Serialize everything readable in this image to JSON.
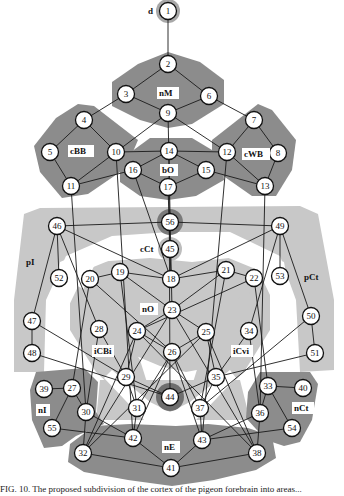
{
  "diagram": {
    "colors": {
      "background": "#ffffff",
      "region_dark": "#8c8c8c",
      "region_light": "#c4c4c4",
      "halo": "#9a9a9a",
      "edge": "#1a1a1a",
      "node_fill": "#ffffff",
      "node_stroke": "#111111",
      "label_box": "#ffffff"
    },
    "regions": [
      {
        "id": "d",
        "label": "d",
        "shade": "halo"
      },
      {
        "id": "nM",
        "label": "nM",
        "shade": "dark"
      },
      {
        "id": "cBB",
        "label": "cBB",
        "shade": "dark"
      },
      {
        "id": "cWB",
        "label": "cWB",
        "shade": "dark"
      },
      {
        "id": "bO",
        "label": "bO",
        "shade": "dark"
      },
      {
        "id": "cCt",
        "label": "cCt",
        "shade": "halo"
      },
      {
        "id": "pI",
        "label": "pI",
        "shade": "light"
      },
      {
        "id": "pCt",
        "label": "pCt",
        "shade": "light"
      },
      {
        "id": "nO",
        "label": "nO",
        "shade": "light"
      },
      {
        "id": "iCBi",
        "label": "iCBi",
        "shade": "light"
      },
      {
        "id": "iCvi",
        "label": "iCvi",
        "shade": "light"
      },
      {
        "id": "nI",
        "label": "nI",
        "shade": "dark"
      },
      {
        "id": "nCt",
        "label": "nCt",
        "shade": "dark"
      },
      {
        "id": "nE",
        "label": "nE",
        "shade": "dark"
      }
    ],
    "nodes": [
      {
        "id": "1",
        "x": 168,
        "y": 11
      },
      {
        "id": "2",
        "x": 168,
        "y": 64
      },
      {
        "id": "3",
        "x": 126,
        "y": 94
      },
      {
        "id": "6",
        "x": 209,
        "y": 96
      },
      {
        "id": "9",
        "x": 168,
        "y": 113
      },
      {
        "id": "4",
        "x": 84,
        "y": 120
      },
      {
        "id": "7",
        "x": 254,
        "y": 120
      },
      {
        "id": "5",
        "x": 50,
        "y": 152
      },
      {
        "id": "10",
        "x": 116,
        "y": 152
      },
      {
        "id": "14",
        "x": 169,
        "y": 151
      },
      {
        "id": "12",
        "x": 227,
        "y": 152
      },
      {
        "id": "8",
        "x": 278,
        "y": 153
      },
      {
        "id": "16",
        "x": 133,
        "y": 170
      },
      {
        "id": "15",
        "x": 206,
        "y": 170
      },
      {
        "id": "17",
        "x": 168,
        "y": 187
      },
      {
        "id": "11",
        "x": 71,
        "y": 186
      },
      {
        "id": "13",
        "x": 265,
        "y": 186
      },
      {
        "id": "56",
        "x": 170,
        "y": 222
      },
      {
        "id": "46",
        "x": 57,
        "y": 226
      },
      {
        "id": "49",
        "x": 280,
        "y": 226
      },
      {
        "id": "45",
        "x": 170,
        "y": 249
      },
      {
        "id": "52",
        "x": 59,
        "y": 278
      },
      {
        "id": "20",
        "x": 90,
        "y": 279
      },
      {
        "id": "19",
        "x": 120,
        "y": 272
      },
      {
        "id": "18",
        "x": 171,
        "y": 279
      },
      {
        "id": "21",
        "x": 226,
        "y": 270
      },
      {
        "id": "22",
        "x": 254,
        "y": 278
      },
      {
        "id": "53",
        "x": 280,
        "y": 276
      },
      {
        "id": "47",
        "x": 32,
        "y": 321
      },
      {
        "id": "23",
        "x": 172,
        "y": 310
      },
      {
        "id": "50",
        "x": 311,
        "y": 316
      },
      {
        "id": "28",
        "x": 99,
        "y": 329
      },
      {
        "id": "24",
        "x": 137,
        "y": 331
      },
      {
        "id": "25",
        "x": 206,
        "y": 332
      },
      {
        "id": "34",
        "x": 249,
        "y": 331
      },
      {
        "id": "48",
        "x": 32,
        "y": 353
      },
      {
        "id": "26",
        "x": 172,
        "y": 352
      },
      {
        "id": "51",
        "x": 315,
        "y": 353
      },
      {
        "id": "29",
        "x": 126,
        "y": 377
      },
      {
        "id": "35",
        "x": 216,
        "y": 377
      },
      {
        "id": "27",
        "x": 72,
        "y": 388
      },
      {
        "id": "39",
        "x": 44,
        "y": 389
      },
      {
        "id": "33",
        "x": 268,
        "y": 386
      },
      {
        "id": "40",
        "x": 303,
        "y": 388
      },
      {
        "id": "44",
        "x": 170,
        "y": 397
      },
      {
        "id": "30",
        "x": 86,
        "y": 412
      },
      {
        "id": "31",
        "x": 137,
        "y": 408
      },
      {
        "id": "37",
        "x": 200,
        "y": 408
      },
      {
        "id": "36",
        "x": 260,
        "y": 413
      },
      {
        "id": "55",
        "x": 52,
        "y": 428
      },
      {
        "id": "54",
        "x": 292,
        "y": 428
      },
      {
        "id": "42",
        "x": 133,
        "y": 438
      },
      {
        "id": "43",
        "x": 202,
        "y": 440
      },
      {
        "id": "32",
        "x": 83,
        "y": 453
      },
      {
        "id": "38",
        "x": 257,
        "y": 453
      },
      {
        "id": "41",
        "x": 171,
        "y": 468
      }
    ],
    "edges": [
      [
        "1",
        "2"
      ],
      [
        "2",
        "3"
      ],
      [
        "2",
        "6"
      ],
      [
        "3",
        "9"
      ],
      [
        "6",
        "9"
      ],
      [
        "3",
        "4"
      ],
      [
        "6",
        "7"
      ],
      [
        "4",
        "5"
      ],
      [
        "4",
        "10"
      ],
      [
        "5",
        "11"
      ],
      [
        "10",
        "11"
      ],
      [
        "9",
        "10"
      ],
      [
        "7",
        "12"
      ],
      [
        "7",
        "8"
      ],
      [
        "8",
        "13"
      ],
      [
        "12",
        "13"
      ],
      [
        "9",
        "12"
      ],
      [
        "10",
        "14"
      ],
      [
        "14",
        "12"
      ],
      [
        "14",
        "16"
      ],
      [
        "14",
        "15"
      ],
      [
        "16",
        "17"
      ],
      [
        "15",
        "17"
      ],
      [
        "11",
        "16"
      ],
      [
        "15",
        "13"
      ],
      [
        "46",
        "56"
      ],
      [
        "56",
        "49"
      ],
      [
        "46",
        "18"
      ],
      [
        "49",
        "18"
      ],
      [
        "46",
        "52"
      ],
      [
        "46",
        "47"
      ],
      [
        "46",
        "28"
      ],
      [
        "49",
        "53"
      ],
      [
        "49",
        "50"
      ],
      [
        "49",
        "34"
      ],
      [
        "45",
        "18"
      ],
      [
        "19",
        "20"
      ],
      [
        "19",
        "18"
      ],
      [
        "19",
        "23"
      ],
      [
        "21",
        "18"
      ],
      [
        "21",
        "22"
      ],
      [
        "21",
        "23"
      ],
      [
        "20",
        "26"
      ],
      [
        "22",
        "24"
      ],
      [
        "47",
        "48"
      ],
      [
        "50",
        "51"
      ],
      [
        "47",
        "29"
      ],
      [
        "51",
        "35"
      ],
      [
        "48",
        "44"
      ],
      [
        "50",
        "37"
      ],
      [
        "23",
        "24"
      ],
      [
        "23",
        "25"
      ],
      [
        "24",
        "26"
      ],
      [
        "25",
        "26"
      ],
      [
        "28",
        "29"
      ],
      [
        "34",
        "35"
      ],
      [
        "29",
        "24"
      ],
      [
        "35",
        "25"
      ],
      [
        "29",
        "44"
      ],
      [
        "35",
        "44"
      ],
      [
        "29",
        "31"
      ],
      [
        "35",
        "37"
      ],
      [
        "27",
        "39"
      ],
      [
        "27",
        "30"
      ],
      [
        "27",
        "55"
      ],
      [
        "33",
        "40"
      ],
      [
        "33",
        "36"
      ],
      [
        "33",
        "54"
      ],
      [
        "30",
        "32"
      ],
      [
        "36",
        "38"
      ],
      [
        "55",
        "42"
      ],
      [
        "54",
        "43"
      ],
      [
        "42",
        "41"
      ],
      [
        "43",
        "41"
      ],
      [
        "32",
        "41"
      ],
      [
        "38",
        "41"
      ],
      [
        "31",
        "42"
      ],
      [
        "37",
        "43"
      ],
      [
        "30",
        "42"
      ],
      [
        "36",
        "43"
      ],
      [
        "32",
        "24"
      ],
      [
        "38",
        "25"
      ],
      [
        "32",
        "23"
      ],
      [
        "38",
        "23"
      ],
      [
        "31",
        "26"
      ],
      [
        "37",
        "26"
      ],
      [
        "19",
        "31"
      ],
      [
        "21",
        "37"
      ],
      [
        "30",
        "28"
      ],
      [
        "36",
        "34"
      ],
      [
        "20",
        "27"
      ],
      [
        "22",
        "33"
      ],
      [
        "11",
        "30"
      ],
      [
        "13",
        "36"
      ],
      [
        "10",
        "42"
      ],
      [
        "12",
        "43"
      ],
      [
        "14",
        "44"
      ],
      [
        "16",
        "18"
      ],
      [
        "9",
        "23"
      ],
      [
        "17",
        "45"
      ],
      [
        "24",
        "38"
      ],
      [
        "25",
        "32"
      ],
      [
        "26",
        "42"
      ],
      [
        "26",
        "43"
      ]
    ],
    "caption": "FIG. 10.  The proposed subdivision of the cortex of the pigeon forebrain into areas..."
  }
}
